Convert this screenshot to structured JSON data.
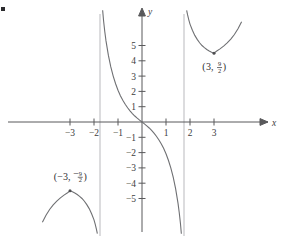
{
  "figure": {
    "title": "",
    "axis_labels": {
      "x": "x",
      "y": "y"
    },
    "corner_mark": "▪"
  },
  "chart_data": {
    "type": "line",
    "title": "",
    "xlabel": "x",
    "ylabel": "y",
    "xlim": [
      -4.2,
      4.2
    ],
    "ylim": [
      -7.4,
      7.4
    ],
    "grid": false,
    "legend": null,
    "x_ticks": [
      -3,
      -2,
      -1,
      1,
      2,
      3
    ],
    "x_tick_labels": [
      "−3",
      "−2",
      "−1",
      "1",
      "2",
      "3"
    ],
    "y_ticks": [
      -5,
      -4,
      -3,
      -2,
      -1,
      1,
      2,
      3,
      4,
      5
    ],
    "y_tick_labels": [
      "−5",
      "−4",
      "−3",
      "−2",
      "−1",
      "1",
      "2",
      "3",
      "4",
      "5"
    ],
    "asymptotes": [
      {
        "type": "vertical",
        "x": -1.75
      },
      {
        "type": "vertical",
        "x": 1.75
      }
    ],
    "series": [
      {
        "name": "left-branch",
        "points": [
          [
            -4.15,
            -6.55
          ],
          [
            -4.0,
            -6.1
          ],
          [
            -3.85,
            -5.72
          ],
          [
            -3.7,
            -5.42
          ],
          [
            -3.55,
            -5.17
          ],
          [
            -3.4,
            -4.96
          ],
          [
            -3.25,
            -4.78
          ],
          [
            -3.1,
            -4.62
          ],
          [
            -3.0,
            -4.5
          ],
          [
            -2.9,
            -4.56
          ],
          [
            -2.8,
            -4.64
          ],
          [
            -2.7,
            -4.74
          ],
          [
            -2.6,
            -4.86
          ],
          [
            -2.5,
            -5.0
          ],
          [
            -2.4,
            -5.18
          ],
          [
            -2.3,
            -5.4
          ],
          [
            -2.2,
            -5.66
          ],
          [
            -2.1,
            -6.0
          ],
          [
            -2.0,
            -6.4
          ],
          [
            -1.95,
            -6.68
          ],
          [
            -1.9,
            -7.0
          ],
          [
            -1.86,
            -7.3
          ]
        ]
      },
      {
        "name": "middle-branch",
        "points": [
          [
            -1.64,
            7.3
          ],
          [
            -1.6,
            6.6
          ],
          [
            -1.55,
            5.9
          ],
          [
            -1.5,
            5.3
          ],
          [
            -1.4,
            4.35
          ],
          [
            -1.3,
            3.6
          ],
          [
            -1.2,
            3.0
          ],
          [
            -1.1,
            2.5
          ],
          [
            -1.0,
            2.08
          ],
          [
            -0.9,
            1.72
          ],
          [
            -0.8,
            1.42
          ],
          [
            -0.7,
            1.16
          ],
          [
            -0.6,
            0.93
          ],
          [
            -0.5,
            0.73
          ],
          [
            -0.4,
            0.55
          ],
          [
            -0.3,
            0.39
          ],
          [
            -0.2,
            0.25
          ],
          [
            -0.1,
            0.12
          ],
          [
            0.0,
            0.0
          ],
          [
            0.1,
            -0.12
          ],
          [
            0.2,
            -0.25
          ],
          [
            0.3,
            -0.39
          ],
          [
            0.4,
            -0.55
          ],
          [
            0.5,
            -0.73
          ],
          [
            0.6,
            -0.93
          ],
          [
            0.7,
            -1.16
          ],
          [
            0.8,
            -1.42
          ],
          [
            0.9,
            -1.72
          ],
          [
            1.0,
            -2.08
          ],
          [
            1.1,
            -2.5
          ],
          [
            1.2,
            -3.0
          ],
          [
            1.3,
            -3.6
          ],
          [
            1.4,
            -4.35
          ],
          [
            1.5,
            -5.3
          ],
          [
            1.55,
            -5.9
          ],
          [
            1.6,
            -6.6
          ],
          [
            1.64,
            -7.3
          ]
        ]
      },
      {
        "name": "right-branch",
        "points": [
          [
            1.86,
            7.3
          ],
          [
            1.9,
            7.0
          ],
          [
            1.95,
            6.68
          ],
          [
            2.0,
            6.4
          ],
          [
            2.1,
            6.0
          ],
          [
            2.2,
            5.66
          ],
          [
            2.3,
            5.4
          ],
          [
            2.4,
            5.18
          ],
          [
            2.5,
            5.0
          ],
          [
            2.6,
            4.86
          ],
          [
            2.7,
            4.74
          ],
          [
            2.8,
            4.64
          ],
          [
            2.9,
            4.56
          ],
          [
            3.0,
            4.5
          ],
          [
            3.1,
            4.62
          ],
          [
            3.25,
            4.78
          ],
          [
            3.4,
            4.96
          ],
          [
            3.55,
            5.17
          ],
          [
            3.7,
            5.42
          ],
          [
            3.85,
            5.72
          ],
          [
            4.0,
            6.1
          ],
          [
            4.15,
            6.55
          ]
        ]
      }
    ],
    "annotations": [
      {
        "name": "max-point-left",
        "x": -3,
        "y": -4.5,
        "marker": true,
        "label_open": "(",
        "label_x": "−3,",
        "label_sign": "−",
        "label_num": "9",
        "label_den": "2",
        "label_close": ")"
      },
      {
        "name": "min-point-right",
        "x": 3,
        "y": 4.5,
        "marker": true,
        "label_open": "(",
        "label_x": "3,",
        "label_sign": "",
        "label_num": "9",
        "label_den": "2",
        "label_close": ")"
      }
    ]
  }
}
